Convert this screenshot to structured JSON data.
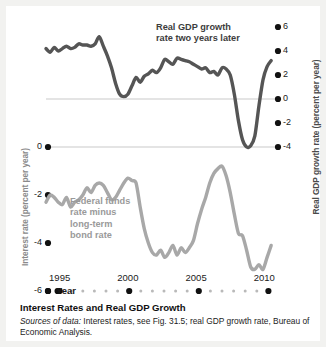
{
  "figure": {
    "caption_title": "Interest Rates and Real GDP Growth",
    "source_label": "Sources of data:",
    "source_text": " Interest rates, see Fig. 31.5; real GDP growth rate, Bureau of Economic Analysis."
  },
  "chart_data": {
    "type": "line",
    "title": "Interest Rates and Real GDP Growth",
    "xlabel": "Year",
    "grid": false,
    "legend_position": "inline-annotations",
    "xlim": [
      1994,
      2011
    ],
    "xticks": [
      1995,
      2000,
      2005,
      2010
    ],
    "xtick_labels": [
      "1995",
      "2000",
      "2005",
      "2010"
    ],
    "left_axis": {
      "label": "Interest rate (percent per year)",
      "ticks": [
        0,
        -2,
        -4,
        -6
      ],
      "tick_labels": [
        "0",
        "-2",
        "-4",
        "-6"
      ],
      "ylim": [
        -6,
        0
      ],
      "color": "#9a9a9a"
    },
    "right_axis": {
      "label": "Real GDP growth rate (percent per year)",
      "ticks": [
        6,
        4,
        2,
        0,
        -2,
        -4
      ],
      "tick_labels": [
        "6",
        "4",
        "2",
        "0",
        "-2",
        "-4"
      ],
      "ylim": [
        -4.7,
        6.7
      ],
      "color": "#4a4a4a"
    },
    "series": [
      {
        "name": "Real GDP growth rate two years later",
        "annotation": "Real GDP growth\nrate two years later",
        "axis": "right",
        "color": "#555555",
        "x": [
          1994.0,
          1994.3,
          1994.6,
          1994.9,
          1995.2,
          1995.5,
          1995.8,
          1996.1,
          1996.4,
          1996.7,
          1997.0,
          1997.3,
          1997.6,
          1997.9,
          1998.2,
          1998.5,
          1998.8,
          1999.1,
          1999.4,
          1999.7,
          2000.0,
          2000.3,
          2000.6,
          2000.9,
          2001.2,
          2001.5,
          2001.8,
          2002.1,
          2002.4,
          2002.7,
          2003.0,
          2003.3,
          2003.6,
          2003.9,
          2004.2,
          2004.5,
          2004.8,
          2005.1,
          2005.4,
          2005.7,
          2006.0,
          2006.3,
          2006.6,
          2006.9,
          2007.2,
          2007.5,
          2007.8,
          2008.1,
          2008.4,
          2008.7,
          2009.0,
          2009.3,
          2009.6,
          2009.9,
          2010.2,
          2010.5
        ],
        "y": [
          4.2,
          3.9,
          4.3,
          4.0,
          4.2,
          4.4,
          4.2,
          4.3,
          4.6,
          4.5,
          4.5,
          4.4,
          4.6,
          5.2,
          4.4,
          3.6,
          2.6,
          1.3,
          0.4,
          0.2,
          0.4,
          1.1,
          1.8,
          1.4,
          1.9,
          2.1,
          2.4,
          2.2,
          2.6,
          3.3,
          3.1,
          2.9,
          3.4,
          3.3,
          3.2,
          3.1,
          2.9,
          2.7,
          2.5,
          2.6,
          2.2,
          2.3,
          2.0,
          2.6,
          2.5,
          2.0,
          0.4,
          -1.8,
          -3.4,
          -4.0,
          -3.9,
          -3.1,
          -0.6,
          1.6,
          2.7,
          3.2
        ]
      },
      {
        "name": "Federal funds rate minus long-term bond rate",
        "annotation": "Federal funds\nrate minus\nlong-term\nbond rate",
        "axis": "left",
        "color": "#a8a8a8",
        "x": [
          1994.0,
          1994.3,
          1994.6,
          1994.9,
          1995.2,
          1995.5,
          1995.8,
          1996.1,
          1996.4,
          1996.7,
          1997.0,
          1997.3,
          1997.6,
          1997.9,
          1998.2,
          1998.5,
          1998.8,
          1999.1,
          1999.4,
          1999.7,
          2000.0,
          2000.3,
          2000.6,
          2000.9,
          2001.2,
          2001.5,
          2001.8,
          2002.1,
          2002.4,
          2002.7,
          2003.0,
          2003.3,
          2003.6,
          2003.9,
          2004.2,
          2004.5,
          2004.8,
          2005.1,
          2005.4,
          2005.7,
          2006.0,
          2006.3,
          2006.6,
          2006.9,
          2007.2,
          2007.5,
          2007.8,
          2008.1,
          2008.4,
          2008.7,
          2009.0,
          2009.3,
          2009.6,
          2009.9,
          2010.2,
          2010.5
        ],
        "y": [
          -2.3,
          -2.0,
          -2.1,
          -2.3,
          -2.4,
          -2.1,
          -2.5,
          -2.3,
          -2.2,
          -2.0,
          -1.7,
          -1.9,
          -1.6,
          -1.5,
          -1.6,
          -1.9,
          -2.2,
          -2.1,
          -1.8,
          -1.5,
          -1.3,
          -1.4,
          -1.5,
          -2.5,
          -3.4,
          -4.0,
          -4.4,
          -4.5,
          -4.3,
          -4.6,
          -4.4,
          -4.1,
          -4.5,
          -4.2,
          -4.4,
          -4.2,
          -3.9,
          -3.2,
          -2.6,
          -2.1,
          -1.5,
          -1.1,
          -0.9,
          -0.8,
          -1.2,
          -1.9,
          -2.8,
          -3.6,
          -3.7,
          -4.3,
          -5.0,
          -5.1,
          -4.9,
          -5.1,
          -4.6,
          -4.1
        ]
      }
    ]
  }
}
